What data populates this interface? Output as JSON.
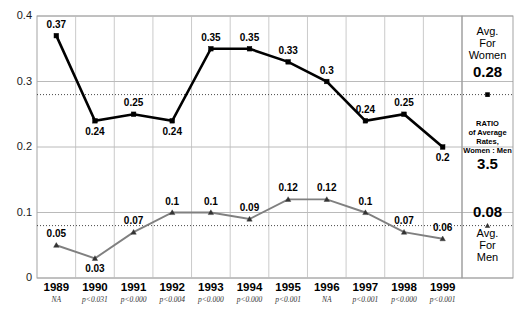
{
  "chart_data": {
    "type": "line",
    "title": "",
    "xlabel": "",
    "ylabel": "",
    "ylim": [
      0,
      0.4
    ],
    "yticks": [
      "0",
      "0.1",
      "0.2",
      "0.3",
      "0.4"
    ],
    "ytick_values": [
      0,
      0.1,
      0.2,
      0.3,
      0.4
    ],
    "grid": true,
    "legend_position": "right-panel",
    "categories": [
      "1989",
      "1990",
      "1991",
      "1992",
      "1993",
      "1994",
      "1995",
      "1996",
      "1997",
      "1998",
      "1999"
    ],
    "series": [
      {
        "name": "Women",
        "color": "#000000",
        "marker": "square",
        "values": [
          0.37,
          0.24,
          0.25,
          0.24,
          0.35,
          0.35,
          0.33,
          0.3,
          0.24,
          0.25,
          0.2
        ],
        "labels": [
          "0.37",
          "0.24",
          "0.25",
          "0.24",
          "0.35",
          "0.35",
          "0.33",
          "0.3",
          "0.24",
          "0.25",
          "0.2"
        ],
        "label_positions": [
          "above",
          "below",
          "above",
          "below",
          "above",
          "above",
          "above",
          "above",
          "above",
          "above",
          "below"
        ]
      },
      {
        "name": "Men",
        "color": "#808080",
        "marker": "triangle",
        "values": [
          0.05,
          0.03,
          0.07,
          0.1,
          0.1,
          0.09,
          0.12,
          0.12,
          0.1,
          0.07,
          0.06
        ],
        "labels": [
          "0.05",
          "0.03",
          "0.07",
          "0.1",
          "0.1",
          "0.09",
          "0.12",
          "0.12",
          "0.1",
          "0.07",
          "0.06"
        ],
        "label_positions": [
          "above",
          "below",
          "above",
          "above",
          "above",
          "above",
          "above",
          "above",
          "above",
          "above",
          "above"
        ]
      }
    ],
    "annotations": {
      "p_values": [
        "NA",
        "p<0.031",
        "p<0.000",
        "p<0.004",
        "p<0.000",
        "p<0.000",
        "p<0.001",
        "NA",
        "p<0.001",
        "p<0.000",
        "p<0.001"
      ],
      "reference_lines": [
        {
          "name": "avg-women",
          "value": 0.28,
          "style": "dotted"
        },
        {
          "name": "avg-men",
          "value": 0.08,
          "style": "dotted"
        }
      ]
    }
  },
  "side_panel": {
    "women": {
      "line1": "Avg.",
      "line2": "For",
      "line3": "Women",
      "value": "0.28"
    },
    "ratio": {
      "line1": "RATIO",
      "line2": "of Average",
      "line3": "Rates,",
      "line4": "Women : Men",
      "value": "3.5"
    },
    "men": {
      "value": "0.08",
      "line1": "Avg.",
      "line2": "For",
      "line3": "Men"
    }
  }
}
